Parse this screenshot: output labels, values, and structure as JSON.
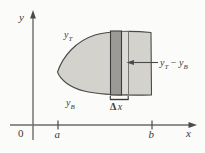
{
  "figure": {
    "name": "area-between-curves-diagram",
    "axes": {
      "y_axis_label": "y",
      "x_axis_label": "x",
      "origin_label": "0",
      "ticks": [
        {
          "label": "a",
          "x": 58
        },
        {
          "label": "b",
          "x": 152
        }
      ]
    },
    "curves": {
      "top_label": "y",
      "top_subscript": "T",
      "bottom_label": "y",
      "bottom_subscript": "B"
    },
    "annotations": {
      "height_label_lead": "y",
      "height_label_lead_sub": "T",
      "height_label_operator": " − ",
      "height_label_trail": "y",
      "height_label_trail_sub": "B",
      "width_label_symbol": "Δ",
      "width_label_variable": "x"
    },
    "colors": {
      "background": "#fbfbf9",
      "region_fill": "#d3d2cd",
      "strip_fill": "#9b9a96",
      "outline_strip_fill": "#dcdbd7",
      "stroke": "#4a4a4a",
      "axis": "#6b6b6b",
      "text": "#3a3a3a"
    }
  }
}
